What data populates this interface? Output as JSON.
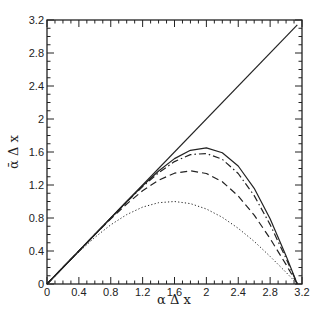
{
  "chart_data": {
    "type": "line",
    "title": "",
    "xlabel": "α Δ x",
    "ylabel": "ᾱ Δ x",
    "xlim": [
      0,
      3.2
    ],
    "ylim": [
      0,
      3.2
    ],
    "grid": false,
    "legend": null,
    "x_ticks": [
      "0",
      "0.4",
      "0.8",
      "1.2",
      "1.6",
      "2",
      "2.4",
      "2.8",
      "3.2"
    ],
    "y_ticks": [
      "0",
      "0.4",
      "0.8",
      "1.2",
      "1.6",
      "2",
      "2.4",
      "2.8",
      "3.2"
    ],
    "x": [
      0,
      0.2,
      0.4,
      0.6,
      0.8,
      1.0,
      1.2,
      1.4,
      1.6,
      1.8,
      2.0,
      2.2,
      2.4,
      2.6,
      2.8,
      3.0,
      3.1416
    ],
    "series": [
      {
        "name": "exact",
        "style": "solid",
        "x": [
          0,
          3.1416
        ],
        "values": [
          0,
          3.1416
        ]
      },
      {
        "name": "solid-curve",
        "style": "solid",
        "values": [
          0,
          0.2,
          0.4,
          0.6,
          0.8,
          1.0,
          1.19,
          1.37,
          1.52,
          1.62,
          1.65,
          1.59,
          1.43,
          1.16,
          0.79,
          0.34,
          0
        ]
      },
      {
        "name": "dash-dot-curve",
        "style": "dashdot",
        "values": [
          0,
          0.2,
          0.4,
          0.6,
          0.799,
          0.994,
          1.181,
          1.349,
          1.484,
          1.568,
          1.582,
          1.512,
          1.339,
          1.071,
          0.72,
          0.309,
          0
        ]
      },
      {
        "name": "dashed-curve",
        "style": "dashed",
        "values": [
          0,
          0.2,
          0.4,
          0.598,
          0.79,
          0.97,
          1.13,
          1.258,
          1.343,
          1.372,
          1.339,
          1.24,
          1.067,
          0.835,
          0.552,
          0.235,
          0
        ]
      },
      {
        "name": "dotted-curve",
        "style": "dotted",
        "values": [
          0,
          0.199,
          0.389,
          0.565,
          0.717,
          0.841,
          0.932,
          0.985,
          1.0,
          0.974,
          0.909,
          0.808,
          0.675,
          0.516,
          0.335,
          0.141,
          0
        ]
      }
    ]
  }
}
